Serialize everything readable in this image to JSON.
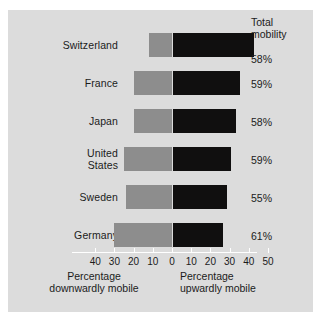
{
  "chart_data": {
    "type": "bar",
    "title": "",
    "subtitle": "",
    "orientation": "horizontal",
    "layout": "diverging",
    "categories": [
      "Switzerland",
      "France",
      "Japan",
      "United States",
      "Sweden",
      "Germany"
    ],
    "series": [
      {
        "name": "Percentage downwardly mobile",
        "values": [
          12,
          20,
          20,
          25,
          24,
          30
        ],
        "color": "#8d8d8d"
      },
      {
        "name": "Percentage upwardly mobile",
        "values": [
          42,
          35,
          33,
          30,
          28,
          26
        ],
        "color": "#100f0f"
      }
    ],
    "total_mobility_header": "Total\nmobility",
    "total_mobility": [
      "58%",
      "59%",
      "58%",
      "59%",
      "55%",
      "61%"
    ],
    "xlabel_left": "Percentage downwardly mobile",
    "xlabel_right": "Percentage upwardly mobile",
    "ylabel": "",
    "xlim": [
      -45,
      50
    ],
    "xticks": [
      -40,
      -30,
      -20,
      -10,
      0,
      10,
      20,
      30,
      40,
      50
    ],
    "xticklabels": [
      "40",
      "30",
      "20",
      "10",
      "0",
      "10",
      "20",
      "30",
      "40",
      "50"
    ],
    "grid": false,
    "legend": "none"
  },
  "panel": {
    "background_color": "#dcdcdc",
    "zero_line_color": "#ffffff"
  },
  "rows": [
    {
      "label": "Switzerland",
      "label_line2": "",
      "down": 12,
      "up": 42,
      "total": "58%"
    },
    {
      "label": "France",
      "label_line2": "",
      "down": 20,
      "up": 35,
      "total": "59%"
    },
    {
      "label": "Japan",
      "label_line2": "",
      "down": 20,
      "up": 33,
      "total": "58%"
    },
    {
      "label": "United",
      "label_line2": "States",
      "down": 25,
      "up": 30,
      "total": "59%"
    },
    {
      "label": "Sweden",
      "label_line2": "",
      "down": 24,
      "up": 28,
      "total": "55%"
    },
    {
      "label": "Germany",
      "label_line2": "",
      "down": 30,
      "up": 26,
      "total": "61%"
    }
  ],
  "header": {
    "line1": "Total",
    "line2": "mobility"
  },
  "axis": {
    "ticks": [
      "40",
      "30",
      "20",
      "10",
      "0",
      "10",
      "20",
      "30",
      "40",
      "50"
    ],
    "caption_left_line1": "Percentage",
    "caption_left_line2": "downwardly mobile",
    "caption_right_line1": "Percentage",
    "caption_right_line2": "upwardly mobile"
  }
}
